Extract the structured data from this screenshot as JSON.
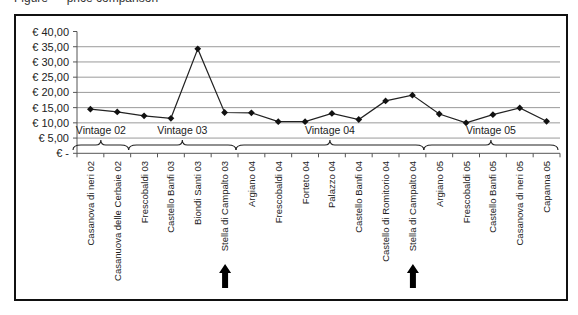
{
  "caption_partial": "Figure — price comparison",
  "chart_data": {
    "type": "line",
    "title": "",
    "xlabel": "",
    "ylabel": "",
    "ylim": [
      0,
      40
    ],
    "yticks": [
      "€ -",
      "€ 5,00",
      "€ 10,00",
      "€ 15,00",
      "€ 20,00",
      "€ 25,00",
      "€ 30,00",
      "€ 35,00",
      "€ 40,00"
    ],
    "grid": true,
    "legend": null,
    "categories": [
      "Casanova di neri 02",
      "Casanuova delle Cerbaie 02",
      "Frescobaldi 03",
      "Castello Banfi 03",
      "Biondi Santi 03",
      "Stella di Campalto 03",
      "Argiano 04",
      "Frescobaldi 04",
      "Forteto 04",
      "Palazzo 04",
      "Castello Banfi 04",
      "Castello di Romitorio 04",
      "Stella di Campalto 04",
      "Argiano 05",
      "Frescobaldi 05",
      "Castello Banfi 05",
      "Casanova di neri 05",
      "Capanna 05"
    ],
    "values": [
      14.5,
      13.6,
      12.3,
      11.5,
      34.3,
      13.4,
      13.3,
      10.4,
      10.4,
      13.1,
      11.1,
      17.2,
      19.1,
      12.9,
      10.0,
      12.7,
      14.9,
      10.5
    ],
    "groups": [
      {
        "label": "Vintage 02",
        "start": 0,
        "end": 1
      },
      {
        "label": "Vintage 03",
        "start": 2,
        "end": 5
      },
      {
        "label": "Vintage 04",
        "start": 6,
        "end": 12
      },
      {
        "label": "Vintage 05",
        "start": 13,
        "end": 17
      }
    ],
    "annotations": [
      {
        "type": "arrow-up",
        "category_index": 5,
        "label": "Stella di Campalto 03"
      },
      {
        "type": "arrow-up",
        "category_index": 12,
        "label": "Stella di Campalto 04"
      }
    ],
    "colors": {
      "line": "#222222",
      "marker": "#111111",
      "grid": "#9a9a9a",
      "axis": "#555555",
      "frame": "#111111"
    }
  }
}
